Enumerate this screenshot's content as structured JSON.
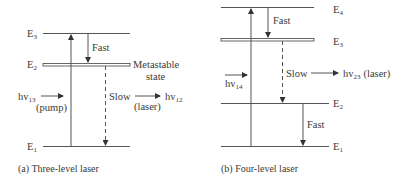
{
  "panels": [
    {
      "id": "a",
      "caption": "(a) Three-level laser",
      "levels": [
        {
          "name": "E",
          "sub": "3"
        },
        {
          "name": "E",
          "sub": "2"
        },
        {
          "name": "E",
          "sub": "1"
        }
      ],
      "annotations": {
        "fast": "Fast",
        "metastable_line1": "Metastable",
        "metastable_line2": "state",
        "slow": "Slow",
        "laser": "(laser)",
        "pump": "(pump)",
        "hv_pump": "hv",
        "hv_pump_sub": "13",
        "hv_emit": "hv",
        "hv_emit_sub": "12"
      }
    },
    {
      "id": "b",
      "caption": "(b) Four-level laser",
      "levels": [
        {
          "name": "E",
          "sub": "4"
        },
        {
          "name": "E",
          "sub": "3"
        },
        {
          "name": "E",
          "sub": "2"
        },
        {
          "name": "E",
          "sub": "1"
        }
      ],
      "annotations": {
        "fast_top": "Fast",
        "slow": "Slow",
        "fast_bottom": "Fast",
        "hv_pump": "hv",
        "hv_pump_sub": "14",
        "hv_emit": "hv",
        "hv_emit_sub": "23",
        "laser": "(laser)"
      }
    }
  ],
  "colors": {
    "line": "#555555",
    "text": "#3a3a3a",
    "background": "#ffffff"
  }
}
